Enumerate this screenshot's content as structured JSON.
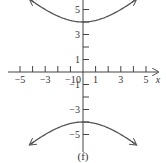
{
  "chart_data": {
    "type": "line",
    "title": "",
    "caption": "(f)",
    "xlabel": "x",
    "ylabel": "y",
    "xlim": [
      -6,
      6.5
    ],
    "ylim": [
      -6,
      6
    ],
    "grid": false,
    "x_ticks": [
      -5,
      -4,
      -3,
      -2,
      -1,
      1,
      2,
      3,
      4,
      5
    ],
    "x_tick_labels": [
      "-5",
      "-3",
      "-1",
      "1",
      "3",
      "5"
    ],
    "x_tick_label_values": [
      -5,
      -3,
      -1,
      1,
      3,
      5
    ],
    "y_ticks": [
      -5,
      -4,
      -3,
      -2,
      -1,
      1,
      2,
      3,
      4,
      5
    ],
    "y_tick_labels": [
      "5",
      "3",
      "1",
      "-1",
      "-3",
      "-5"
    ],
    "y_tick_label_values": [
      5,
      3,
      1,
      -1,
      -3,
      -5
    ],
    "origin_label": "0",
    "series": [
      {
        "name": "upper branch",
        "equation": "y = sqrt(16 + x^2)",
        "x": [
          -4,
          -3,
          -2,
          -1,
          0,
          1,
          2,
          3,
          4
        ],
        "y": [
          5.66,
          5.0,
          4.47,
          4.12,
          4.0,
          4.12,
          4.47,
          5.0,
          5.66
        ],
        "arrows": true
      },
      {
        "name": "lower branch",
        "equation": "y = -sqrt(16 + x^2)",
        "x": [
          -4,
          -3,
          -2,
          -1,
          0,
          1,
          2,
          3,
          4
        ],
        "y": [
          -5.66,
          -5.0,
          -4.47,
          -4.12,
          -4.0,
          -4.12,
          -4.47,
          -5.0,
          -5.66
        ],
        "arrows": true
      }
    ],
    "colors": {
      "curve": "#555555",
      "axis": "#444444",
      "text": "#333333"
    }
  }
}
